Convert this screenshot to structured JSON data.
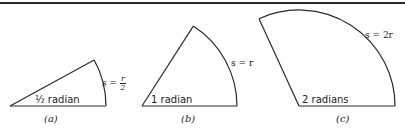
{
  "figure": {
    "panels": [
      {
        "id": "a",
        "caption": "(a)",
        "angle_label": "½ radian",
        "arc_label_lhs": "s",
        "arc_label_eq": "=",
        "arc_label_num": "r",
        "arc_label_den": "2"
      },
      {
        "id": "b",
        "caption": "(b)",
        "angle_label": "1 radian",
        "arc_label": "s = r"
      },
      {
        "id": "c",
        "caption": "(c)",
        "angle_label": "2 radians",
        "arc_label": "s = 2r"
      }
    ],
    "colors": {
      "stroke": "#2a2a2a",
      "background": "#ffffff"
    }
  }
}
